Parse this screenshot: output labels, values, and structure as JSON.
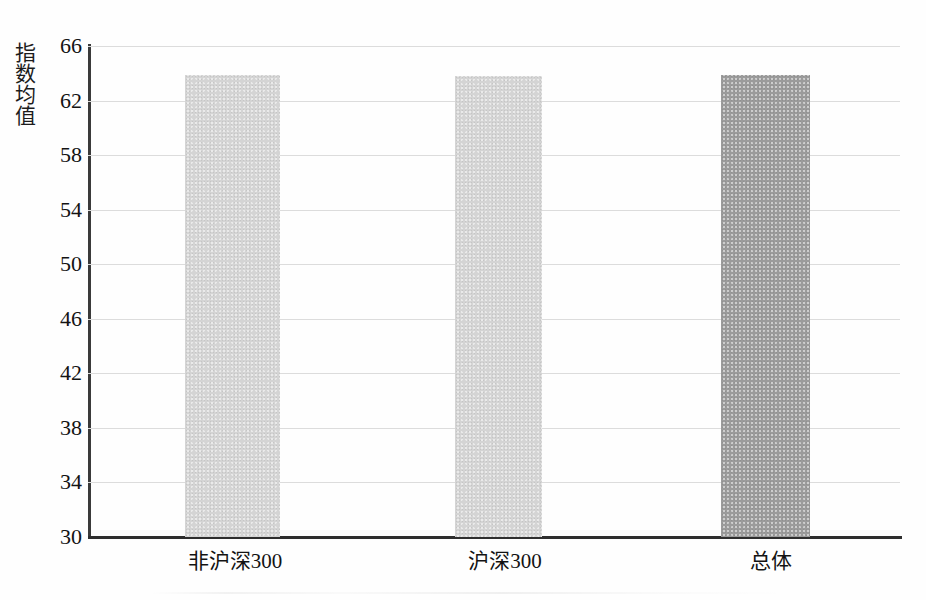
{
  "chart_data": {
    "type": "bar",
    "title": "",
    "xlabel": "",
    "ylabel": "指数均值",
    "categories": [
      "非沪深300",
      "沪深300",
      "总体"
    ],
    "values": [
      63.9,
      63.8,
      63.9
    ],
    "ylim": [
      30,
      66
    ],
    "yticks": [
      66,
      62,
      58,
      54,
      50,
      46,
      42,
      38,
      34,
      30
    ],
    "ytick_labels": [
      "66",
      "62",
      "58",
      "54",
      "50",
      "46",
      "42",
      "38",
      "34",
      "30"
    ],
    "grid": true,
    "legend": false,
    "legend_position": "none",
    "bar_colors": [
      "#d4d4d4",
      "#d4d4d4",
      "#9b9b9b"
    ],
    "series": [
      {
        "name": "指数均值",
        "values": [
          63.9,
          63.8,
          63.9
        ]
      }
    ]
  },
  "axes": {
    "y_title": "指数均值",
    "tick_0": "66",
    "tick_1": "62",
    "tick_2": "58",
    "tick_3": "54",
    "tick_4": "50",
    "tick_5": "46",
    "tick_6": "42",
    "tick_7": "38",
    "tick_8": "34",
    "tick_9": "30",
    "cat_0": "非沪深300",
    "cat_1": "沪深300",
    "cat_2": "总体"
  }
}
